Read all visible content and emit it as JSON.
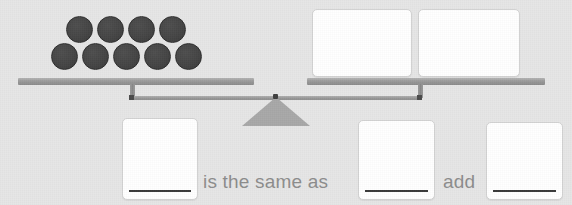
{
  "scene": {
    "type": "balance-scale-worksheet",
    "background_color": "#e6e6e6"
  },
  "balance": {
    "left_pan": {
      "counter_count": 9,
      "counter_color": "#454545",
      "rows": [
        {
          "count": 4,
          "positions_x": [
            66,
            97,
            128,
            159
          ],
          "y": 16
        },
        {
          "count": 5,
          "positions_x": [
            51,
            82,
            113,
            144,
            175
          ],
          "y": 43
        }
      ]
    },
    "right_pan": {
      "boxes": [
        {
          "value": "",
          "placeholder": ""
        },
        {
          "value": "",
          "placeholder": ""
        }
      ]
    },
    "fulcrum_color": "#a8a8a8",
    "beam_color": "#999999"
  },
  "sentence": {
    "first_box": {
      "value": "",
      "placeholder": ""
    },
    "connector_label": "is the same as",
    "second_box": {
      "value": "",
      "placeholder": ""
    },
    "operator_label": "add",
    "third_box": {
      "value": "",
      "placeholder": ""
    },
    "text_color": "#8d8d8d"
  }
}
